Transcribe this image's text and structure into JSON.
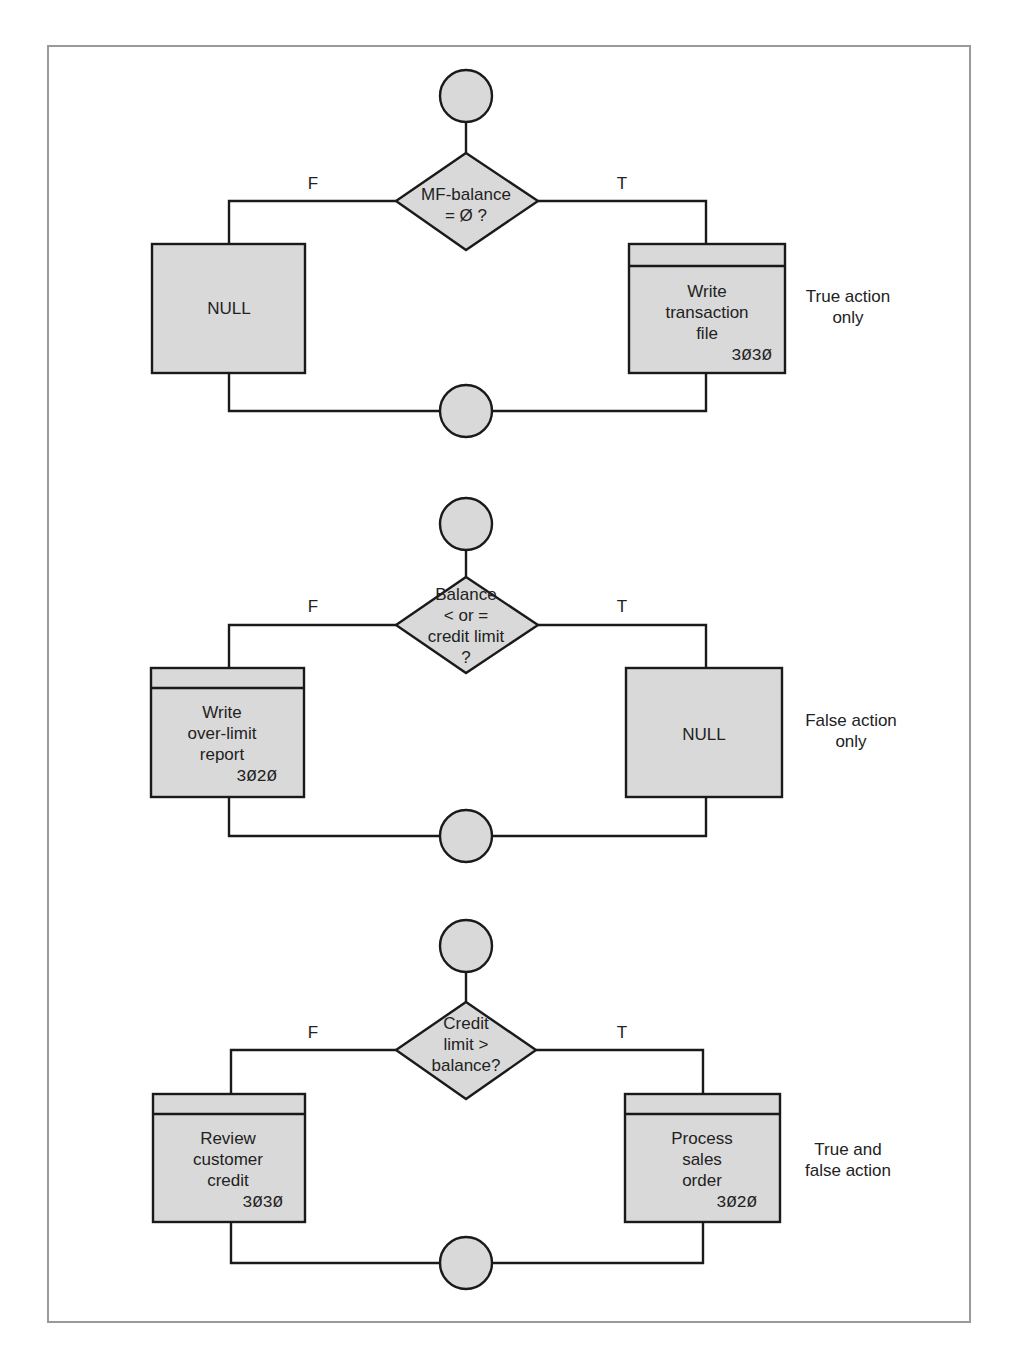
{
  "colors": {
    "shape_fill": "#d9d9d9",
    "stroke": "#1a1a1a",
    "frame": "#9a9a9a",
    "text": "#222222"
  },
  "sections": [
    {
      "decision": {
        "lines": [
          "MF-balance",
          "= Ø ?"
        ]
      },
      "false_label": "F",
      "true_label": "T",
      "false_box": {
        "type": "null",
        "lines": [
          "NULL"
        ],
        "code": ""
      },
      "true_box": {
        "type": "module",
        "lines": [
          "Write",
          "transaction",
          "file"
        ],
        "code": "3Ø3Ø"
      },
      "note": [
        "True action",
        "only"
      ]
    },
    {
      "decision": {
        "lines": [
          "Balance",
          "< or =",
          "credit limit",
          "?"
        ]
      },
      "false_label": "F",
      "true_label": "T",
      "false_box": {
        "type": "module",
        "lines": [
          "Write",
          "over-limit",
          "report"
        ],
        "code": "3Ø2Ø"
      },
      "true_box": {
        "type": "null",
        "lines": [
          "NULL"
        ],
        "code": ""
      },
      "note": [
        "False action",
        "only"
      ]
    },
    {
      "decision": {
        "lines": [
          "Credit",
          "limit >",
          "balance?"
        ]
      },
      "false_label": "F",
      "true_label": "T",
      "false_box": {
        "type": "module",
        "lines": [
          "Review",
          "customer",
          "credit"
        ],
        "code": "3Ø3Ø"
      },
      "true_box": {
        "type": "module",
        "lines": [
          "Process",
          "sales",
          "order"
        ],
        "code": "3Ø2Ø"
      },
      "note": [
        "True and",
        "false action"
      ]
    }
  ]
}
